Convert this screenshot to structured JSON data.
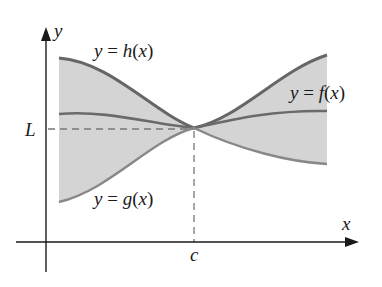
{
  "diagram": {
    "type": "squeeze-theorem-illustration",
    "labels": {
      "h_curve": "y = h(x)",
      "f_curve": "y = f(x)",
      "g_curve": "y = g(x)",
      "y_axis": "y",
      "x_axis": "x",
      "limit_value": "L",
      "point": "c"
    },
    "colors": {
      "curve": "#666666",
      "shade": "#d3d3d3",
      "axis": "#1a1a1a",
      "dashed": "#777777"
    }
  }
}
